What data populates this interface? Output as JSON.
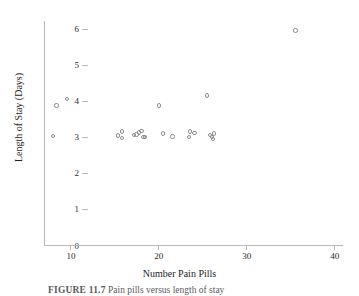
{
  "figure": {
    "caption_label": "FIGURE 11.7",
    "caption_text": "Pain pills versus length of stay"
  },
  "chart_data": {
    "type": "scatter",
    "title": "",
    "xlabel": "Number Pain Pills",
    "ylabel": "Length of Stay (Days)",
    "xlim": [
      7,
      41
    ],
    "ylim": [
      0,
      6.3
    ],
    "xticks": [
      10,
      20,
      30,
      40
    ],
    "yticks": [
      0,
      1,
      2,
      3,
      4,
      5,
      6
    ],
    "grid": false,
    "legend": "none",
    "marker": "open-circle",
    "marker_color": "#8d8d8d",
    "axis_color": "#b9b9b9",
    "points": [
      {
        "x": 8.0,
        "y": 3.02
      },
      {
        "x": 8.4,
        "y": 3.87
      },
      {
        "x": 9.6,
        "y": 4.05
      },
      {
        "x": 15.4,
        "y": 3.04
      },
      {
        "x": 15.9,
        "y": 3.15
      },
      {
        "x": 15.9,
        "y": 2.97
      },
      {
        "x": 17.2,
        "y": 3.06
      },
      {
        "x": 17.5,
        "y": 3.07
      },
      {
        "x": 17.8,
        "y": 3.12
      },
      {
        "x": 18.1,
        "y": 3.16
      },
      {
        "x": 18.3,
        "y": 3.0
      },
      {
        "x": 18.5,
        "y": 2.99
      },
      {
        "x": 20.1,
        "y": 3.87
      },
      {
        "x": 20.5,
        "y": 3.09
      },
      {
        "x": 21.6,
        "y": 3.01
      },
      {
        "x": 23.5,
        "y": 3.0
      },
      {
        "x": 23.6,
        "y": 3.15
      },
      {
        "x": 24.1,
        "y": 3.11
      },
      {
        "x": 25.5,
        "y": 4.15
      },
      {
        "x": 25.9,
        "y": 3.06
      },
      {
        "x": 26.1,
        "y": 3.0
      },
      {
        "x": 26.2,
        "y": 2.95
      },
      {
        "x": 26.3,
        "y": 3.1
      },
      {
        "x": 35.6,
        "y": 5.95
      }
    ]
  }
}
